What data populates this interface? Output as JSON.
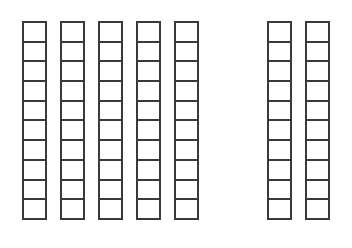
{
  "figure": {
    "name": "base-ten-rods-diagram",
    "background_color": "#ffffff",
    "stroke_color": "#3a3a3a",
    "fill_color": "#ffffff",
    "stroke_width_px": 2,
    "cell_width_px": 25,
    "cell_height_px": 22,
    "total_rods": 7,
    "cells_per_rod": 10,
    "total_units": 70
  },
  "groups": [
    {
      "id": "group-left",
      "label": "left-group",
      "rod_count": 5,
      "rods": [
        {
          "id": "rod-1",
          "cells": 10
        },
        {
          "id": "rod-2",
          "cells": 10
        },
        {
          "id": "rod-3",
          "cells": 10
        },
        {
          "id": "rod-4",
          "cells": 10
        },
        {
          "id": "rod-5",
          "cells": 10
        }
      ]
    },
    {
      "id": "group-right",
      "label": "right-group",
      "rod_count": 2,
      "rods": [
        {
          "id": "rod-6",
          "cells": 10
        },
        {
          "id": "rod-7",
          "cells": 10
        }
      ]
    }
  ]
}
